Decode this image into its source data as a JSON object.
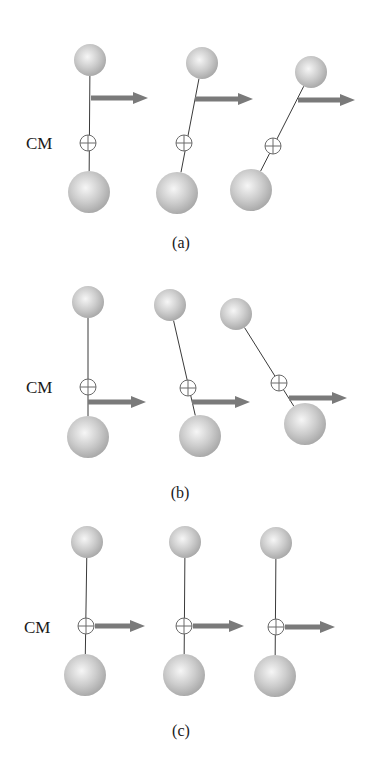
{
  "figure": {
    "colors": {
      "ball_light": "#f4f4f4",
      "ball_mid": "#c8c8c8",
      "ball_dark": "#a9a9a9",
      "rod": "#3a3a3a",
      "arrow": "#7a7a7a",
      "cm_marker": "#6a6a6a"
    },
    "panels": [
      {
        "caption": "(a)",
        "cm_label": "CM",
        "cm_label_pos": [
          26,
          149
        ],
        "caption_pos": [
          181,
          248
        ],
        "frames": [
          {
            "top": [
              90,
              60,
              16
            ],
            "bottom": [
              89,
              192,
              21
            ],
            "cm": [
              88,
              143
            ],
            "arrow": [
              91,
              98,
              148
            ]
          },
          {
            "top": [
              202,
              63,
              16
            ],
            "bottom": [
              177,
              193,
              21
            ],
            "cm": [
              184,
              143
            ],
            "arrow": [
              195,
              99,
              253
            ]
          },
          {
            "top": [
              311,
              72,
              16
            ],
            "bottom": [
              251,
              190,
              21
            ],
            "cm": [
              273,
              146
            ],
            "arrow": [
              298,
              100,
              355
            ]
          }
        ]
      },
      {
        "caption": "(b)",
        "cm_label": "CM",
        "cm_label_pos": [
          26,
          393
        ],
        "caption_pos": [
          180,
          498
        ],
        "frames": [
          {
            "top": [
              88,
              302,
              16
            ],
            "bottom": [
              88,
              437,
              21
            ],
            "cm": [
              88,
              387
            ],
            "arrow": [
              88,
              402,
              146
            ]
          },
          {
            "top": [
              170,
              305,
              16
            ],
            "bottom": [
              200,
              436,
              21
            ],
            "cm": [
              188,
              388
            ],
            "arrow": [
              192,
              402,
              250
            ]
          },
          {
            "top": [
              236,
              314,
              16
            ],
            "bottom": [
              305,
              424,
              21
            ],
            "cm": [
              279,
              383
            ],
            "arrow": [
              289,
              398,
              347
            ]
          }
        ]
      },
      {
        "caption": "(c)",
        "cm_label": "CM",
        "cm_label_pos": [
          24,
          633
        ],
        "caption_pos": [
          181,
          736
        ],
        "frames": [
          {
            "top": [
              87,
              542,
              16
            ],
            "bottom": [
              85,
              675,
              21
            ],
            "cm": [
              86,
              626
            ],
            "arrow": [
              95,
              626,
              145
            ]
          },
          {
            "top": [
              185,
              542,
              16
            ],
            "bottom": [
              184,
              675,
              21
            ],
            "cm": [
              184,
              626
            ],
            "arrow": [
              193,
              626,
              244
            ]
          },
          {
            "top": [
              276,
              543,
              16
            ],
            "bottom": [
              275,
              676,
              21
            ],
            "cm": [
              276,
              627
            ],
            "arrow": [
              285,
              627,
              335
            ]
          }
        ]
      }
    ]
  }
}
